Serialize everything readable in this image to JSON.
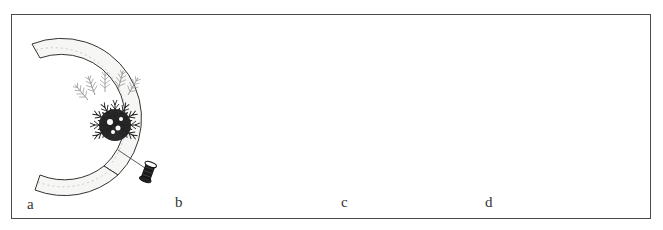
{
  "figure": {
    "panels": [
      {
        "id": "a",
        "label": "a",
        "caption_hint": "first bundle of greens bound to bare ring frame with wire from spool"
      },
      {
        "id": "b",
        "label": "b",
        "caption_hint": "bundles overlapped around the ring, wire continuing to spool"
      },
      {
        "id": "c",
        "label": "c",
        "caption_hint": "double-sided frame covered with greens, wire wrapped across"
      },
      {
        "id": "d",
        "label": "d",
        "caption_hint": "next bundle positioned (dashed arrow) to overlap previous bundle stems"
      }
    ],
    "colors": {
      "ink": "#1c1c1c",
      "frame_border": "#4a4a4a",
      "ring_fill": "#f4f4f2",
      "greens_dark": "#262626",
      "greens_light": "#8a8a8a",
      "background": "#ffffff"
    },
    "icons": [
      "wire-spool-icon",
      "dashed-arrow-icon",
      "evergreen-bundle-icon",
      "ring-frame-icon"
    ]
  }
}
